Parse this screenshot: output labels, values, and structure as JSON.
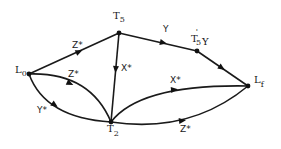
{
  "diagram": {
    "type": "directed-graph",
    "nodes": {
      "L0": {
        "main": "L",
        "sub": "0"
      },
      "T5": {
        "main": "T",
        "sub": "5"
      },
      "T5pY": {
        "main": "T",
        "sup": "'",
        "sub": "5",
        "suffix": "Y"
      },
      "Lf": {
        "main": "L",
        "sub": "f"
      },
      "T2": {
        "main": "T",
        "sub": "2"
      }
    },
    "edges": [
      {
        "from": "L0",
        "to": "T5",
        "label": "Z*"
      },
      {
        "from": "T5",
        "to": "T5pY",
        "label": "Y"
      },
      {
        "from": "T5pY",
        "to": "Lf",
        "label": ""
      },
      {
        "from": "T5",
        "to": "T2",
        "label": "X*"
      },
      {
        "from": "L0",
        "to": "T2",
        "label": "Z*",
        "route": "upper"
      },
      {
        "from": "L0",
        "to": "T2",
        "label": "Y*",
        "route": "lower"
      },
      {
        "from": "T2",
        "to": "Lf",
        "label": "X*",
        "route": "upper"
      },
      {
        "from": "T2",
        "to": "Lf",
        "label": "Z*",
        "route": "lower"
      }
    ]
  }
}
